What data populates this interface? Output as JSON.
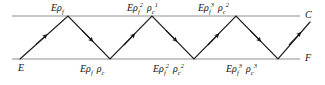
{
  "diagram": {
    "type": "zigzag-reflection-diagram",
    "line_color": "#b4b4b4",
    "path_color": "#1a1a1a",
    "axes": {
      "ceiling": {
        "label": "C",
        "y": 16
      },
      "floor": {
        "label": "F",
        "y": 59
      }
    },
    "origin_label": "E",
    "top_labels": [
      {
        "base": "E",
        "rho1": "ρ",
        "sub1": "f",
        "sup1": "",
        "rho2": "",
        "sub2": "",
        "sup2": ""
      },
      {
        "base": "E",
        "rho1": "ρ",
        "sub1": "f",
        "sup1": "2",
        "rho2": "ρ",
        "sub2": "c",
        "sup2": "1"
      },
      {
        "base": "E",
        "rho1": "ρ",
        "sub1": "f",
        "sup1": "3",
        "rho2": "ρ",
        "sub2": "c",
        "sup2": "2"
      }
    ],
    "bottom_labels": [
      {
        "base": "E",
        "rho1": "ρ",
        "sub1": "f",
        "sup1": "",
        "rho2": "ρ",
        "sub2": "c",
        "sup2": ""
      },
      {
        "base": "E",
        "rho1": "ρ",
        "sub1": "f",
        "sup1": "2",
        "rho2": "ρ",
        "sub2": "c",
        "sup2": "2"
      },
      {
        "base": "E",
        "rho1": "ρ",
        "sub1": "f",
        "sup1": "3",
        "rho2": "ρ",
        "sub2": "c",
        "sup2": "3"
      }
    ],
    "path_points": "20,59 68,16 110,59 152,16 194,59 236,16 278,59 310,22",
    "arrow_segments": [
      {
        "x": 44,
        "y": 37.5,
        "dir": "up-right"
      },
      {
        "x": 89,
        "y": 37.5,
        "dir": "down-right"
      },
      {
        "x": 131,
        "y": 37.5,
        "dir": "up-right"
      },
      {
        "x": 173,
        "y": 37.5,
        "dir": "down-right"
      },
      {
        "x": 215,
        "y": 37.5,
        "dir": "up-right"
      },
      {
        "x": 257,
        "y": 37.5,
        "dir": "down-right"
      },
      {
        "x": 296,
        "y": 38.5,
        "dir": "up-right"
      }
    ]
  }
}
